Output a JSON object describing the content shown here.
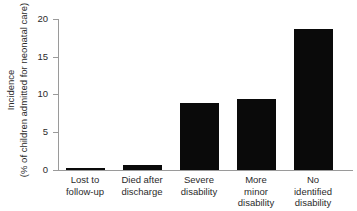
{
  "chart_data": {
    "type": "bar",
    "title": "",
    "subtitle": "",
    "xlabel": "",
    "ylabel": "Incidence (% of children admitted for neonatal care)",
    "ylabel_line1": "Incidence",
    "ylabel_line2": "(% of children admitted for neonatal care)",
    "ylim": [
      0,
      20
    ],
    "yticks": [
      0,
      5,
      10,
      15,
      20
    ],
    "ytick_labels": [
      "0",
      "5",
      "10",
      "15",
      "20"
    ],
    "grid": false,
    "legend": "none",
    "bar_color": "#0a0a0a",
    "axis_color": "#9a9a9a",
    "categories": [
      "Lost to follow-up",
      "Died after discharge",
      "Severe disability",
      "More minor disability",
      "No identified disability"
    ],
    "category_lines": [
      [
        "Lost to",
        "follow-up"
      ],
      [
        "Died after",
        "discharge"
      ],
      [
        "Severe",
        "disability"
      ],
      [
        "More",
        "minor",
        "disability"
      ],
      [
        "No",
        "identified",
        "disability"
      ]
    ],
    "values": [
      0.25,
      0.7,
      8.85,
      9.45,
      18.65
    ],
    "series": [
      {
        "name": "Incidence",
        "values": [
          0.25,
          0.7,
          8.85,
          9.45,
          18.65
        ]
      }
    ]
  }
}
